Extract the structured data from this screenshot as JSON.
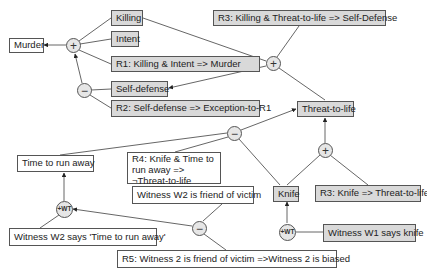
{
  "diagram": {
    "type": "argument-map",
    "nodes": {
      "murder": "Murder",
      "killing": "Killing",
      "intent": "Intent",
      "r1": "R1: Killing & Intent => Murder",
      "self_defense": "Self-defense",
      "r2": "R2: Self-defense => Exception-to-R1",
      "r3_self_defense": "R3: Killing & Threat-to-life => Self-Defense",
      "threat_to_life": "Threat-to-life",
      "time_to_run_away": "Time to run away",
      "r4": "R4: Knife & Time to run away => ¬Threat-to-life",
      "witness_w2_friend": "Witness W2 is friend of victim",
      "knife": "Knife",
      "r3_knife": "R3: Knife => Threat-to-life",
      "witness_w2_says": "Witness W2 says 'Time to run away'",
      "witness_w1_says": "Witness W1 says knife",
      "r5": "R5: Witness 2 is friend of victim =>Witness 2 is biased"
    },
    "operators": {
      "plus_murder": "+",
      "minus_self_defense": "−",
      "plus_self_defense": "+",
      "minus_threat": "−",
      "plus_threat": "+",
      "wt_time": "+WT",
      "minus_bias": "−",
      "wt_knife": "+WT"
    },
    "colors": {
      "premise_fill": "#d9d9d9",
      "conclusion_fill": "#ffffff",
      "stroke": "#555555"
    }
  }
}
